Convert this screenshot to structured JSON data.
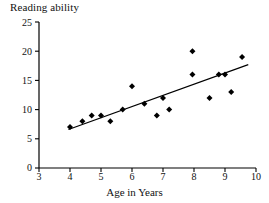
{
  "chart_data": {
    "type": "scatter",
    "title": "Reading ability",
    "xlabel": "Age in Years",
    "ylabel": "",
    "xlim": [
      3,
      10
    ],
    "ylim": [
      0,
      25
    ],
    "xticks": [
      3,
      4,
      5,
      6,
      7,
      8,
      9,
      10
    ],
    "yticks": [
      0,
      5,
      10,
      15,
      20,
      25
    ],
    "grid": false,
    "legend": false,
    "series": [
      {
        "name": "Reading ability vs age",
        "marker": "diamond",
        "color": "#000000",
        "points": [
          {
            "x": 4.0,
            "y": 7
          },
          {
            "x": 4.4,
            "y": 8
          },
          {
            "x": 4.7,
            "y": 9
          },
          {
            "x": 5.0,
            "y": 9
          },
          {
            "x": 5.3,
            "y": 8
          },
          {
            "x": 5.7,
            "y": 10
          },
          {
            "x": 6.0,
            "y": 14
          },
          {
            "x": 6.4,
            "y": 11
          },
          {
            "x": 6.8,
            "y": 9
          },
          {
            "x": 7.0,
            "y": 12
          },
          {
            "x": 7.2,
            "y": 10
          },
          {
            "x": 7.95,
            "y": 20
          },
          {
            "x": 7.95,
            "y": 16
          },
          {
            "x": 8.5,
            "y": 12
          },
          {
            "x": 8.8,
            "y": 16
          },
          {
            "x": 9.0,
            "y": 16
          },
          {
            "x": 9.2,
            "y": 13
          },
          {
            "x": 9.55,
            "y": 19
          }
        ]
      }
    ],
    "trendline": {
      "name": "least-squares fit",
      "color": "#000000",
      "x_start": 3.95,
      "y_start": 6.6,
      "x_end": 9.75,
      "y_end": 17.7
    }
  },
  "axis": {
    "y_tick_labels": [
      "25",
      "20",
      "15",
      "10",
      "5",
      "0"
    ],
    "x_tick_labels": [
      "3",
      "4",
      "5",
      "6",
      "7",
      "8",
      "9",
      "10"
    ]
  },
  "colors": {
    "axis": "#000000",
    "marker": "#000000",
    "trendline": "#000000",
    "background": "#ffffff",
    "text": "#111111"
  }
}
